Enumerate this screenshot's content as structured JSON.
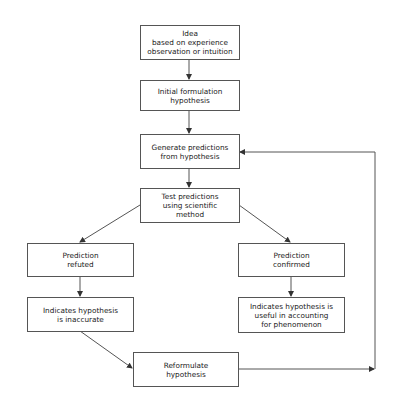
{
  "diagram": {
    "type": "flowchart",
    "colors": {
      "line": "#555555",
      "box_border": "#555555",
      "text": "#222222",
      "background": "#ffffff"
    },
    "nodes": [
      {
        "id": "idea",
        "label": "Idea\nbased on experience\nobservation or intuition"
      },
      {
        "id": "initial",
        "label": "Initial formulation\nhypothesis"
      },
      {
        "id": "generate",
        "label": "Generate predictions\nfrom hypothesis"
      },
      {
        "id": "test",
        "label": "Test predictions\nusing scientific\nmethod"
      },
      {
        "id": "refuted",
        "label": "Prediction\nrefuted"
      },
      {
        "id": "confirmed",
        "label": "Prediction\nconfirmed"
      },
      {
        "id": "inaccurate",
        "label": "Indicates hypothesis\nis inaccurate"
      },
      {
        "id": "useful",
        "label": "Indicates hypothesis is\nuseful in accounting\nfor phenomenon"
      },
      {
        "id": "reformulate",
        "label": "Reformulate\nhypothesis"
      }
    ],
    "edges": [
      {
        "from": "idea",
        "to": "initial"
      },
      {
        "from": "initial",
        "to": "generate"
      },
      {
        "from": "generate",
        "to": "test"
      },
      {
        "from": "test",
        "to": "refuted"
      },
      {
        "from": "test",
        "to": "confirmed"
      },
      {
        "from": "refuted",
        "to": "inaccurate"
      },
      {
        "from": "confirmed",
        "to": "useful"
      },
      {
        "from": "inaccurate",
        "to": "reformulate"
      },
      {
        "from": "reformulate",
        "to": "generate",
        "route": "right loop"
      }
    ]
  }
}
